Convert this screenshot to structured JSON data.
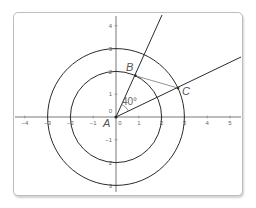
{
  "diagram": {
    "axes": {
      "x_ticks": [
        {
          "value": -4,
          "label": "−4"
        },
        {
          "value": -3,
          "label": "−3"
        },
        {
          "value": -2,
          "label": "−2"
        },
        {
          "value": -1,
          "label": "−1"
        },
        {
          "value": 0,
          "label": "0"
        },
        {
          "value": 1,
          "label": "1"
        },
        {
          "value": 2,
          "label": "2"
        },
        {
          "value": 3,
          "label": "3"
        },
        {
          "value": 4,
          "label": "4"
        },
        {
          "value": 5,
          "label": "5"
        }
      ],
      "y_ticks": [
        {
          "value": 4,
          "label": "4"
        },
        {
          "value": 3,
          "label": "3"
        },
        {
          "value": 2,
          "label": "2"
        },
        {
          "value": 1,
          "label": "1"
        },
        {
          "value": 0,
          "label": "0"
        },
        {
          "value": -1,
          "label": "−1"
        },
        {
          "value": -2,
          "label": "2"
        },
        {
          "value": -3,
          "label": "3"
        }
      ]
    },
    "circles": [
      {
        "name": "inner-circle",
        "radius": 2
      },
      {
        "name": "outer-circle",
        "radius": 3
      }
    ],
    "points": {
      "A": {
        "label": "A",
        "x": 0,
        "y": 0
      },
      "B": {
        "label": "B",
        "radius": 2,
        "angle_deg": 65
      },
      "C": {
        "label": "C",
        "radius": 3,
        "angle_deg": 25
      }
    },
    "angle": {
      "label": "40°",
      "value_deg": 40
    },
    "colors": {
      "line": "#2b2b2b",
      "axis": "#555555",
      "chord": "#777777",
      "text": "#555555"
    }
  }
}
